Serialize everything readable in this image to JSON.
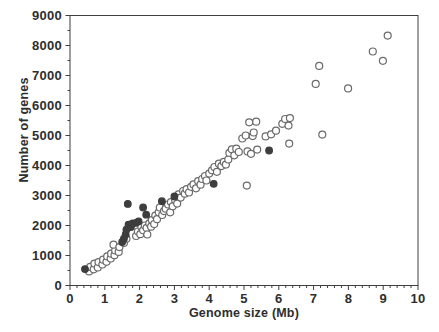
{
  "chart_data": {
    "type": "scatter",
    "title": "",
    "xlabel": "Genome size (Mb)",
    "ylabel": "Number of genes",
    "xlim": [
      0,
      10
    ],
    "ylim": [
      0,
      9000
    ],
    "x_major_ticks": [
      0,
      1,
      2,
      3,
      4,
      5,
      6,
      7,
      8,
      9,
      10
    ],
    "x_minor_step": 0.2,
    "y_major_ticks": [
      0,
      1000,
      2000,
      3000,
      4000,
      5000,
      6000,
      7000,
      8000,
      9000
    ],
    "y_minor_step": 500,
    "grid": false,
    "legend_position": "none",
    "axis_color": "#3f3f3f",
    "tick_label_color": "#2e2e2e",
    "marker": {
      "radius_open": 3.5,
      "radius_filled": 3.3,
      "stroke_width": 1.2,
      "open_stroke": "#6a6a6a",
      "open_fill": "#ffffff",
      "filled_fill": "#3d3d3d"
    },
    "series": [
      {
        "name": "open-circles",
        "marker": "circle-open",
        "points": [
          [
            0.55,
            470
          ],
          [
            0.58,
            620
          ],
          [
            0.68,
            540
          ],
          [
            0.7,
            730
          ],
          [
            0.8,
            600
          ],
          [
            0.82,
            780
          ],
          [
            0.93,
            700
          ],
          [
            0.95,
            860
          ],
          [
            1.05,
            790
          ],
          [
            1.07,
            970
          ],
          [
            1.17,
            900
          ],
          [
            1.18,
            1060
          ],
          [
            1.28,
            1010
          ],
          [
            1.3,
            1170
          ],
          [
            1.25,
            1360
          ],
          [
            1.4,
            1120
          ],
          [
            1.42,
            1280
          ],
          [
            1.55,
            1420
          ],
          [
            1.62,
            1560
          ],
          [
            1.9,
            1650
          ],
          [
            1.95,
            1800
          ],
          [
            2.02,
            1710
          ],
          [
            2.05,
            1950
          ],
          [
            2.1,
            1840
          ],
          [
            2.15,
            2000
          ],
          [
            2.2,
            1920
          ],
          [
            2.22,
            1700
          ],
          [
            2.28,
            2070
          ],
          [
            2.33,
            1960
          ],
          [
            2.35,
            2180
          ],
          [
            2.42,
            2050
          ],
          [
            2.45,
            2330
          ],
          [
            2.5,
            2210
          ],
          [
            2.55,
            2440
          ],
          [
            2.58,
            2600
          ],
          [
            2.65,
            2350
          ],
          [
            2.7,
            2480
          ],
          [
            2.75,
            2560
          ],
          [
            2.82,
            2700
          ],
          [
            2.88,
            2440
          ],
          [
            2.9,
            2780
          ],
          [
            2.95,
            2640
          ],
          [
            3.02,
            2850
          ],
          [
            3.08,
            2730
          ],
          [
            3.12,
            3040
          ],
          [
            3.18,
            2930
          ],
          [
            3.25,
            3150
          ],
          [
            3.3,
            3060
          ],
          [
            3.35,
            3210
          ],
          [
            3.42,
            3100
          ],
          [
            3.48,
            3290
          ],
          [
            3.55,
            3370
          ],
          [
            3.62,
            3240
          ],
          [
            3.68,
            3480
          ],
          [
            3.75,
            3360
          ],
          [
            3.8,
            3550
          ],
          [
            3.88,
            3650
          ],
          [
            3.92,
            3500
          ],
          [
            4.0,
            3730
          ],
          [
            4.08,
            3840
          ],
          [
            4.15,
            3950
          ],
          [
            4.22,
            3790
          ],
          [
            4.28,
            4060
          ],
          [
            4.35,
            3980
          ],
          [
            4.42,
            4120
          ],
          [
            4.48,
            4030
          ],
          [
            4.55,
            4200
          ],
          [
            4.58,
            4420
          ],
          [
            4.65,
            4540
          ],
          [
            4.72,
            4340
          ],
          [
            4.78,
            4560
          ],
          [
            4.85,
            4450
          ],
          [
            4.95,
            4900
          ],
          [
            5.05,
            5000
          ],
          [
            5.1,
            4470
          ],
          [
            5.15,
            5440
          ],
          [
            5.2,
            4390
          ],
          [
            5.25,
            4980
          ],
          [
            5.28,
            5100
          ],
          [
            5.35,
            5460
          ],
          [
            5.38,
            4530
          ],
          [
            5.62,
            4970
          ],
          [
            5.78,
            5040
          ],
          [
            5.92,
            5160
          ],
          [
            6.1,
            5390
          ],
          [
            6.18,
            5550
          ],
          [
            6.28,
            5330
          ],
          [
            6.32,
            5580
          ],
          [
            6.3,
            4730
          ],
          [
            5.08,
            3330
          ],
          [
            7.06,
            6720
          ],
          [
            7.16,
            7320
          ],
          [
            7.25,
            5030
          ],
          [
            7.99,
            6570
          ],
          [
            8.7,
            7800
          ],
          [
            8.99,
            7490
          ],
          [
            9.13,
            8330
          ]
        ]
      },
      {
        "name": "filled-circles",
        "marker": "circle-filled",
        "points": [
          [
            0.43,
            545
          ],
          [
            1.5,
            1450
          ],
          [
            1.55,
            1560
          ],
          [
            1.6,
            1700
          ],
          [
            1.62,
            1860
          ],
          [
            1.68,
            2030
          ],
          [
            1.75,
            1950
          ],
          [
            1.8,
            2070
          ],
          [
            1.9,
            2090
          ],
          [
            1.97,
            2140
          ],
          [
            1.66,
            2720
          ],
          [
            2.1,
            2600
          ],
          [
            2.19,
            2360
          ],
          [
            2.64,
            2810
          ],
          [
            3.0,
            2970
          ],
          [
            4.13,
            3390
          ],
          [
            5.72,
            4500
          ]
        ]
      }
    ]
  }
}
